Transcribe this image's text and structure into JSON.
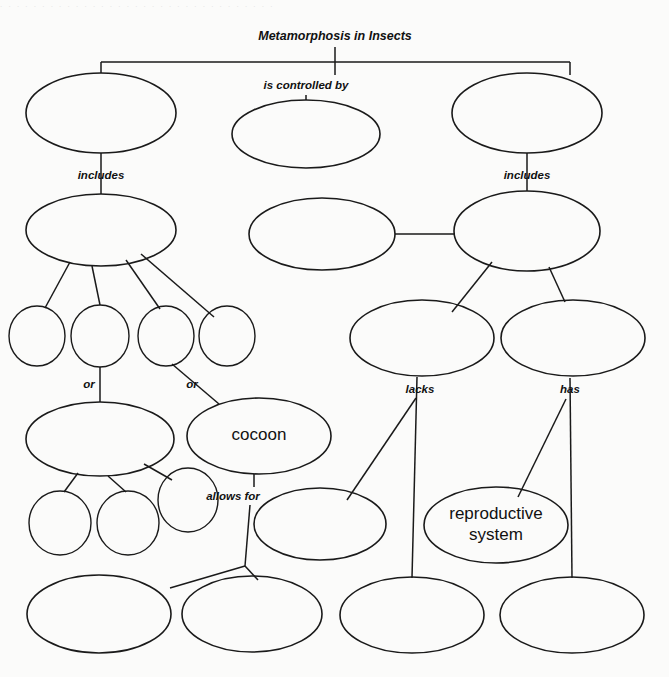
{
  "document": {
    "kind": "concept-map",
    "title": "Metamorphosis in Insects",
    "background_color": "#fbfbfa",
    "ink_color": "#1a1a1a"
  },
  "title_node": {
    "label": "Metamorphosis in Insects",
    "x": 335,
    "y": 37
  },
  "link_labels": [
    {
      "id": "is-controlled-by",
      "text": "is controlled by",
      "x": 306,
      "y": 86
    },
    {
      "id": "includes-left",
      "text": "includes",
      "x": 101,
      "y": 176
    },
    {
      "id": "includes-right",
      "text": "includes",
      "x": 527,
      "y": 176
    },
    {
      "id": "or-left",
      "text": "or",
      "x": 89,
      "y": 385
    },
    {
      "id": "or-right",
      "text": "or",
      "x": 192,
      "y": 385
    },
    {
      "id": "lacks",
      "text": "lacks",
      "x": 420,
      "y": 390
    },
    {
      "id": "has",
      "text": "has",
      "x": 570,
      "y": 390
    },
    {
      "id": "allows-for",
      "text": "allows for",
      "x": 233,
      "y": 497
    }
  ],
  "nodes": [
    {
      "id": "n1",
      "label": "",
      "shape": "ellipse",
      "cx": 101,
      "cy": 113,
      "rx": 75,
      "ry": 40
    },
    {
      "id": "n2",
      "label": "",
      "shape": "ellipse",
      "cx": 306,
      "cy": 134,
      "rx": 74,
      "ry": 34
    },
    {
      "id": "n3",
      "label": "",
      "shape": "ellipse",
      "cx": 527,
      "cy": 113,
      "rx": 75,
      "ry": 40
    },
    {
      "id": "n4",
      "label": "",
      "shape": "ellipse",
      "cx": 101,
      "cy": 230,
      "rx": 75,
      "ry": 36
    },
    {
      "id": "n5",
      "label": "",
      "shape": "ellipse",
      "cx": 322,
      "cy": 234,
      "rx": 73,
      "ry": 36
    },
    {
      "id": "n6",
      "label": "",
      "shape": "ellipse",
      "cx": 527,
      "cy": 231,
      "rx": 73,
      "ry": 40
    },
    {
      "id": "n7",
      "label": "",
      "shape": "ellipse",
      "cx": 37,
      "cy": 336,
      "rx": 28,
      "ry": 30
    },
    {
      "id": "n8",
      "label": "",
      "shape": "ellipse",
      "cx": 100,
      "cy": 336,
      "rx": 29,
      "ry": 31
    },
    {
      "id": "n9",
      "label": "",
      "shape": "ellipse",
      "cx": 166,
      "cy": 336,
      "rx": 28,
      "ry": 30
    },
    {
      "id": "n10",
      "label": "",
      "shape": "ellipse",
      "cx": 227,
      "cy": 336,
      "rx": 28,
      "ry": 30
    },
    {
      "id": "n11",
      "label": "",
      "shape": "ellipse",
      "cx": 422,
      "cy": 338,
      "rx": 72,
      "ry": 38
    },
    {
      "id": "n12",
      "label": "",
      "shape": "ellipse",
      "cx": 573,
      "cy": 338,
      "rx": 72,
      "ry": 38
    },
    {
      "id": "n13",
      "label": "",
      "shape": "ellipse",
      "cx": 100,
      "cy": 439,
      "rx": 74,
      "ry": 37
    },
    {
      "id": "n14",
      "label": "cocoon",
      "shape": "ellipse",
      "cx": 259,
      "cy": 436,
      "rx": 72,
      "ry": 38
    },
    {
      "id": "n15",
      "label": "",
      "shape": "ellipse",
      "cx": 60,
      "cy": 523,
      "rx": 31,
      "ry": 32
    },
    {
      "id": "n16",
      "label": "",
      "shape": "ellipse",
      "cx": 128,
      "cy": 523,
      "rx": 31,
      "ry": 32
    },
    {
      "id": "n17",
      "label": "",
      "shape": "ellipse",
      "cx": 188,
      "cy": 500,
      "rx": 30,
      "ry": 32
    },
    {
      "id": "n18",
      "label": "",
      "shape": "ellipse",
      "cx": 320,
      "cy": 524,
      "rx": 66,
      "ry": 36
    },
    {
      "id": "n19",
      "label": "reproductive system",
      "shape": "ellipse",
      "cx": 496,
      "cy": 525,
      "rx": 72,
      "ry": 38
    },
    {
      "id": "n20",
      "label": "",
      "shape": "ellipse",
      "cx": 99,
      "cy": 614,
      "rx": 72,
      "ry": 39
    },
    {
      "id": "n21",
      "label": "",
      "shape": "ellipse",
      "cx": 252,
      "cy": 614,
      "rx": 70,
      "ry": 38
    },
    {
      "id": "n22",
      "label": "",
      "shape": "ellipse",
      "cx": 412,
      "cy": 615,
      "rx": 72,
      "ry": 38
    },
    {
      "id": "n23",
      "label": "",
      "shape": "ellipse",
      "cx": 572,
      "cy": 615,
      "rx": 72,
      "ry": 38
    }
  ],
  "connectors": [
    {
      "id": "title-stem",
      "d": "M 335 47 L 335 75"
    },
    {
      "id": "root-bus",
      "d": "M 101 62 L 570 62"
    },
    {
      "id": "branch-left",
      "d": "M 101 62 L 101 73"
    },
    {
      "id": "branch-right",
      "d": "M 570 62 L 570 75"
    },
    {
      "id": "n2-stem",
      "d": "M 306 95 L 306 100"
    },
    {
      "id": "n1-to-n4",
      "d": "M 101 153 L 101 194"
    },
    {
      "id": "n3-to-n6",
      "d": "M 527 153 L 527 191"
    },
    {
      "id": "n4-to-n7",
      "d": "M 70 262 L 45 308"
    },
    {
      "id": "n4-to-n8",
      "d": "M 92 266 L 100 305"
    },
    {
      "id": "n4-to-n9",
      "d": "M 126 260 L 160 309"
    },
    {
      "id": "n4-to-n10",
      "d": "M 141 254 L 214 317"
    },
    {
      "id": "n5-to-n6",
      "d": "M 395 234 L 455 234"
    },
    {
      "id": "n6-to-n11",
      "d": "M 492 262 L 452 312"
    },
    {
      "id": "n6-to-n12",
      "d": "M 549 267 L 565 302"
    },
    {
      "id": "n8-to-n13",
      "d": "M 100 367 L 100 402"
    },
    {
      "id": "n9-to-n14",
      "d": "M 172 364 L 219 404"
    },
    {
      "id": "n11-to-n22",
      "d": "M 417 377 L 412 578"
    },
    {
      "id": "n11-to-n18",
      "d": "M 416 398 L 347 500"
    },
    {
      "id": "n12-to-n23",
      "d": "M 570 378 L 572 578"
    },
    {
      "id": "n12-to-n19",
      "d": "M 566 399 L 518 497"
    },
    {
      "id": "n13-to-n15",
      "d": "M 78 473 L 64 492"
    },
    {
      "id": "n13-to-n16",
      "d": "M 108 476 L 126 492"
    },
    {
      "id": "n13-to-n17",
      "d": "M 144 464 L 172 480"
    },
    {
      "id": "n14-to-stem",
      "d": "M 254 474 L 254 487"
    },
    {
      "id": "allows-stem",
      "d": "M 250 505 L 245 566"
    },
    {
      "id": "n-mid-to-n21",
      "d": "M 245 566 L 170 588"
    },
    {
      "id": "n-mid-to-n18",
      "d": "M 245 566 L 258 580"
    }
  ],
  "top_edge_artifact": ". . . . . . . . . . . . . . . . . . . . . . . . . . . . . . . . ."
}
